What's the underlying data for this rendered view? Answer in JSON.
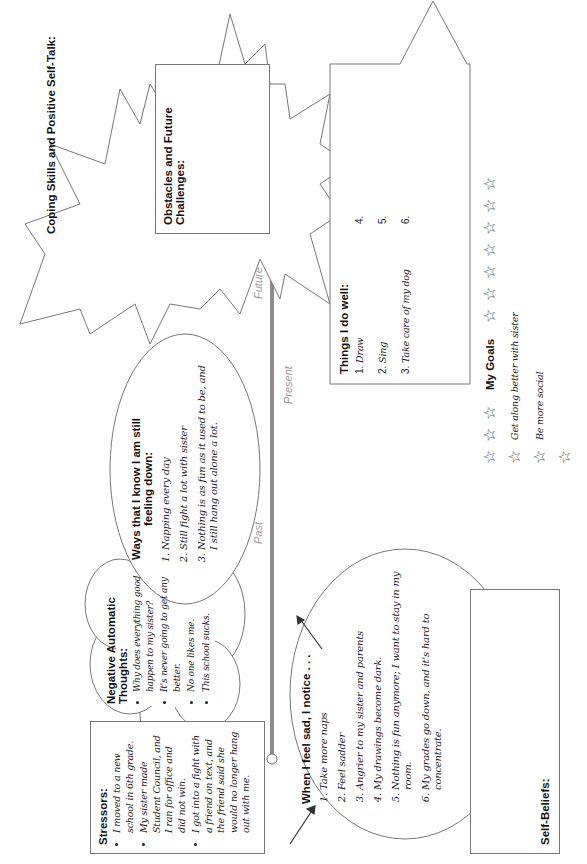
{
  "worksheet": {
    "stressors": {
      "title": "Stressors:",
      "items": [
        "I moved to a new school in 6th grade.",
        "My sister made Student Council, and I ran for office and did not win.",
        "I got into a fight with a friend on text, and the friend said she would no longer hang out with me."
      ]
    },
    "negative_thoughts": {
      "title": "Negative Automatic Thoughts:",
      "items": [
        "Why does everything good happen to my sister?",
        "It's never going to get any better.",
        "No one likes me.",
        "This school sucks."
      ]
    },
    "when_sad": {
      "title": "When I feel sad, I notice . . .",
      "items": [
        "Take more naps",
        "Feel sadder",
        "Angrier to my sister and parents",
        "My drawings become dark.",
        "Nothing is fun anymore; I want to stay in my room.",
        "My grades go down, and it's hard to concentrate."
      ]
    },
    "still_down": {
      "title": "Ways that I know I am still feeling down:",
      "items": [
        "Napping every day",
        "Still fight a lot with sister",
        "Nothing is as fun as it used to be, and I still hang out alone a lot."
      ]
    },
    "timeline": {
      "past": "Past",
      "present": "Present",
      "future": "Future"
    },
    "coping": {
      "title": "Coping Skills and Positive Self-Talk:"
    },
    "obstacles": {
      "title": "Obstacles and Future Challenges:"
    },
    "things_well": {
      "title": "Things I do well:",
      "items": [
        {
          "num": "1.",
          "text": "Draw"
        },
        {
          "num": "2.",
          "text": "Sing"
        },
        {
          "num": "3.",
          "text": "Take care of my dog"
        },
        {
          "num": "4.",
          "text": ""
        },
        {
          "num": "5.",
          "text": ""
        },
        {
          "num": "6.",
          "text": ""
        }
      ]
    },
    "goals": {
      "title": "My Goals",
      "items": [
        "Get along better with sister",
        "Be more social",
        ""
      ],
      "star_glyph": "☆"
    },
    "self_beliefs": {
      "title": "Self-Beliefs:"
    }
  },
  "colors": {
    "line": "#777777",
    "timeline_bar": "#8c8c8c",
    "label_gray": "#9a9a9a",
    "text": "#1a1a1a"
  }
}
